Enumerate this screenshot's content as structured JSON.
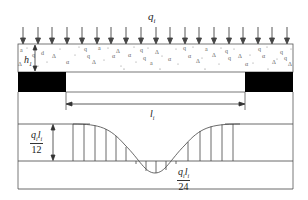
{
  "diagram": {
    "title": "",
    "load": {
      "label": "q",
      "subscript": "i",
      "arrow_count": 19,
      "direction": "down"
    },
    "soil_layer": {
      "thickness_label": "h",
      "thickness_subscript": "1",
      "fill": "granular aggregate pattern"
    },
    "supports": [
      {
        "side": "left",
        "fill": "#000000"
      },
      {
        "side": "right",
        "fill": "#000000"
      }
    ],
    "span": {
      "label": "l",
      "subscript": "i"
    },
    "moment_diagram": {
      "support_moment": {
        "numerator": "q",
        "numerator_sub": "i",
        "numerator_l": "l",
        "numerator_l_sub": "i",
        "denominator": "12"
      },
      "midspan_moment": {
        "numerator": "q",
        "numerator_sub": "i",
        "numerator_l": "l",
        "numerator_l_sub": "i",
        "denominator": "24"
      }
    },
    "colors": {
      "line": "#333333",
      "support": "#000000",
      "background": "#ffffff"
    }
  }
}
